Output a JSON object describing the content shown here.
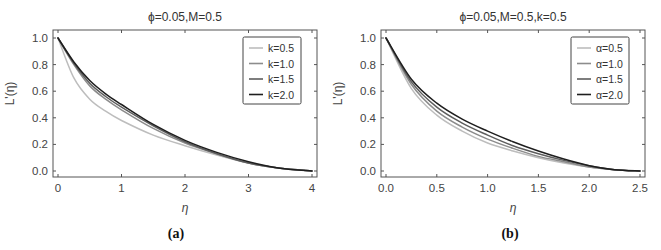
{
  "chart_data": [
    {
      "type": "line",
      "panel": "(a)",
      "title": "ϕ=0.05,M=0.5",
      "xlabel": "η",
      "ylabel": "L'(η)",
      "xlim": [
        0,
        4
      ],
      "ylim": [
        0,
        1
      ],
      "xticks": [
        "0",
        "1",
        "2",
        "3",
        "4"
      ],
      "yticks": [
        "0.0",
        "0.2",
        "0.4",
        "0.6",
        "0.8",
        "1.0"
      ],
      "grid": false,
      "legend_position": "upper right",
      "x": [
        0,
        0.25,
        0.5,
        0.75,
        1.0,
        1.5,
        2.0,
        2.5,
        3.0,
        3.5,
        4.0
      ],
      "series": [
        {
          "name": "k=0.5",
          "color": "#bdbdbd",
          "values": [
            1.0,
            0.7,
            0.54,
            0.45,
            0.38,
            0.27,
            0.19,
            0.12,
            0.06,
            0.02,
            0.0
          ]
        },
        {
          "name": "k=1.0",
          "color": "#8c8c8c",
          "values": [
            1.0,
            0.8,
            0.64,
            0.54,
            0.46,
            0.32,
            0.21,
            0.13,
            0.06,
            0.02,
            0.0
          ]
        },
        {
          "name": "k=1.5",
          "color": "#5e5e5e",
          "values": [
            1.0,
            0.81,
            0.66,
            0.56,
            0.48,
            0.34,
            0.22,
            0.13,
            0.06,
            0.02,
            0.0
          ]
        },
        {
          "name": "k=2.0",
          "color": "#1e1e1e",
          "values": [
            1.0,
            0.82,
            0.68,
            0.58,
            0.5,
            0.35,
            0.23,
            0.14,
            0.07,
            0.02,
            0.0
          ]
        }
      ]
    },
    {
      "type": "line",
      "panel": "(b)",
      "title": "ϕ=0.05,M=0.5,k=0.5",
      "xlabel": "η",
      "ylabel": "L'(η)",
      "xlim": [
        0,
        2.5
      ],
      "ylim": [
        0,
        1
      ],
      "xticks": [
        "0.0",
        "0.5",
        "1.0",
        "1.5",
        "2.0",
        "2.5"
      ],
      "yticks": [
        "0.0",
        "0.2",
        "0.4",
        "0.6",
        "0.8",
        "1.0"
      ],
      "grid": false,
      "legend_position": "upper right",
      "x": [
        0,
        0.25,
        0.5,
        0.75,
        1.0,
        1.25,
        1.5,
        1.75,
        2.0,
        2.25,
        2.5
      ],
      "series": [
        {
          "name": "α=0.5",
          "color": "#bdbdbd",
          "values": [
            1.0,
            0.62,
            0.42,
            0.3,
            0.21,
            0.15,
            0.1,
            0.06,
            0.03,
            0.01,
            0.0
          ]
        },
        {
          "name": "α=1.0",
          "color": "#8c8c8c",
          "values": [
            1.0,
            0.65,
            0.45,
            0.33,
            0.24,
            0.17,
            0.11,
            0.07,
            0.03,
            0.01,
            0.0
          ]
        },
        {
          "name": "α=1.5",
          "color": "#5e5e5e",
          "values": [
            1.0,
            0.67,
            0.48,
            0.36,
            0.27,
            0.19,
            0.13,
            0.08,
            0.04,
            0.01,
            0.0
          ]
        },
        {
          "name": "α=2.0",
          "color": "#1e1e1e",
          "values": [
            1.0,
            0.69,
            0.51,
            0.39,
            0.3,
            0.22,
            0.15,
            0.09,
            0.04,
            0.01,
            0.0
          ]
        }
      ]
    }
  ],
  "captions": [
    "(a)",
    "(b)"
  ]
}
